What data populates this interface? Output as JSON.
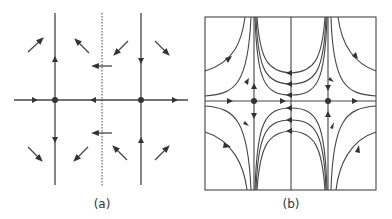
{
  "figure": {
    "panels": [
      {
        "id": "a",
        "label": "(a)",
        "description": "Phase portrait sketch: two fixed points on horizontal axis with direction arrows and a dotted symmetry line"
      },
      {
        "id": "b",
        "label": "(b)",
        "description": "Phase portrait with trajectories inside a box; two saddle points on the horizontal axis"
      }
    ],
    "colors": {
      "line": "#444444",
      "dot": "#333333",
      "background": "#ffffff"
    }
  }
}
